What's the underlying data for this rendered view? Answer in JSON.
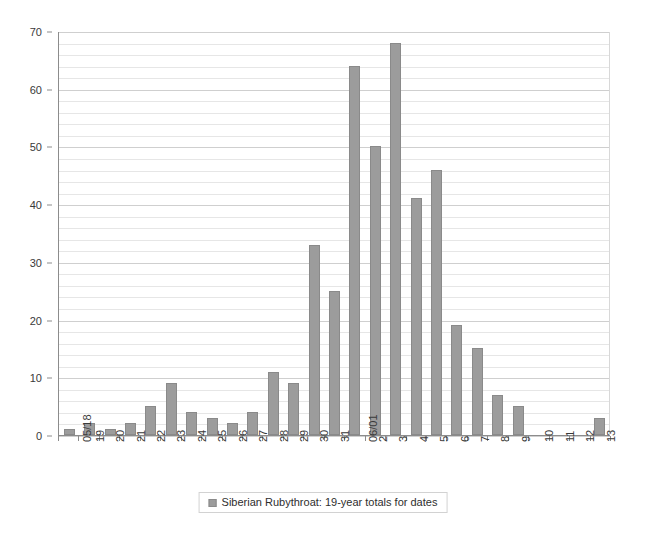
{
  "chart_data": {
    "type": "bar",
    "title": "",
    "subtitle": "",
    "xlabel": "",
    "ylabel": "",
    "ylim": [
      0,
      70
    ],
    "y_major_step": 10,
    "y_minor_step": 2,
    "grid": true,
    "legend_position": "bottom",
    "series_color": "#9c9c9c",
    "categories": [
      "05/18",
      "19",
      "20",
      "21",
      "22",
      "23",
      "24",
      "25",
      "26",
      "27",
      "28",
      "29",
      "30",
      "31",
      "06/01",
      "2",
      "3",
      "4",
      "5",
      "6",
      "7",
      "8",
      "9",
      "10",
      "11",
      "12",
      "13"
    ],
    "values": [
      1,
      2,
      1,
      2,
      5,
      9,
      4,
      3,
      2,
      4,
      11,
      9,
      33,
      25,
      64,
      50,
      68,
      41,
      46,
      19,
      15,
      7,
      5,
      0,
      0,
      0,
      3
    ],
    "series": [
      {
        "name": "Siberian Rubythroat: 19-year totals for dates",
        "values": [
          1,
          2,
          1,
          2,
          5,
          9,
          4,
          3,
          2,
          4,
          11,
          9,
          33,
          25,
          64,
          50,
          68,
          41,
          46,
          19,
          15,
          7,
          5,
          0,
          0,
          0,
          3
        ]
      }
    ],
    "y_ticks": [
      "0",
      "10",
      "20",
      "30",
      "40",
      "50",
      "60",
      "70"
    ],
    "legend": [
      {
        "label": "Siberian Rubythroat: 19-year totals for dates",
        "color": "#9c9c9c"
      }
    ]
  }
}
